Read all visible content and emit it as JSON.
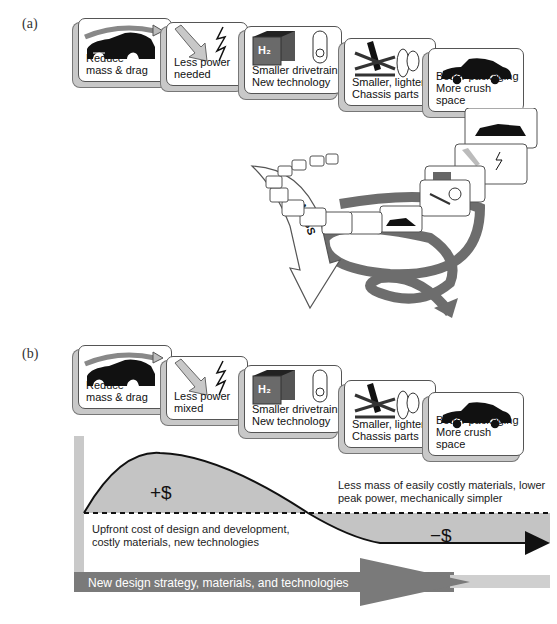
{
  "panel_a": {
    "label": "(a)",
    "cards": [
      {
        "icon": "car-drag-icon",
        "line1": "Reduce",
        "line2": "mass & drag"
      },
      {
        "icon": "arrow-lightning-icon",
        "line1": "Less power",
        "line2": "needed"
      },
      {
        "icon": "h2-drivetrain-icon",
        "line1": "Smaller drivetrain",
        "line2": "New technology"
      },
      {
        "icon": "chassis-parts-icon",
        "line1": "Smaller, lighter",
        "line2": "Chassis parts"
      },
      {
        "icon": "sedan-icon",
        "line1": "Better packaging",
        "line2": "More crush space"
      }
    ],
    "h2_label": "H₂",
    "mass_label": "MASS"
  },
  "panel_b": {
    "label": "(b)",
    "cards": [
      {
        "icon": "car-drag-icon",
        "line1": "Reduce",
        "line2": "mass & drag"
      },
      {
        "icon": "arrow-lightning-icon",
        "line1": "Less power",
        "line2": "mixed"
      },
      {
        "icon": "h2-drivetrain-icon",
        "line1": "Smaller drivetrain",
        "line2": "New technology"
      },
      {
        "icon": "chassis-parts-icon",
        "line1": "Smaller, lighter",
        "line2": "Chassis parts"
      },
      {
        "icon": "sedan-icon",
        "line1": "Better packaging",
        "line2": "More crush space"
      }
    ],
    "h2_label": "H₂",
    "plus_sign": "+$",
    "minus_sign": "−$",
    "upfront_note_1": "Upfront cost of design and development,",
    "upfront_note_2": "costly materials, new technologies",
    "savings_note_1": "Less mass of easily costly materials, lower",
    "savings_note_2": "peak power, mechanically simpler",
    "strategy_label": "New design strategy, materials, and technologies"
  },
  "colors": {
    "card_border": "#555555",
    "card_shadow": "#c8c8c8",
    "fill_gray": "#c4c4c4",
    "dark_arrow": "#7a7a7a",
    "light_bar": "#cfcfcf"
  }
}
